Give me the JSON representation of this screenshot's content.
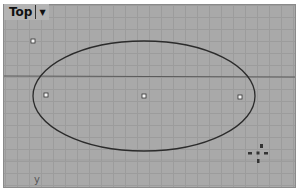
{
  "viewport": {
    "name": "Top",
    "menu_icon": "dropdown-caret-icon",
    "colors": {
      "background": "#a9a9a9",
      "grid": "#9c9c9c",
      "x_axis": "#5a5a5a",
      "curve": "#2b2b2b",
      "control_point_fill": "#f5f5f5",
      "control_point_stroke": "#333333"
    },
    "axis_label_y": "y",
    "gizmo": {
      "icon": "navigation-gizmo-icon",
      "labels": [
        "3",
        "w",
        "e",
        "s"
      ]
    }
  },
  "scene": {
    "ellipse": {
      "cx": 144,
      "cy": 96,
      "rx": 111,
      "ry": 55
    },
    "x_axis_y": 76,
    "control_points": [
      {
        "x": 46,
        "y": 95
      },
      {
        "x": 144,
        "y": 96
      },
      {
        "x": 240,
        "y": 97
      }
    ],
    "free_point": {
      "x": 33,
      "y": 41
    }
  }
}
